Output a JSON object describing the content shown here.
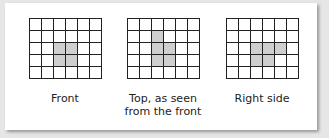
{
  "diagram": {
    "grid_rows": 5,
    "grid_cols": 6,
    "shade_color": "#cfcfcf",
    "views": [
      {
        "caption": "Front",
        "shaded": [
          [
            2,
            2
          ],
          [
            2,
            3
          ],
          [
            3,
            2
          ],
          [
            3,
            3
          ]
        ]
      },
      {
        "caption": "Top, as seen\nfrom the front",
        "shaded": [
          [
            1,
            2
          ],
          [
            2,
            2
          ],
          [
            2,
            3
          ],
          [
            3,
            2
          ],
          [
            3,
            3
          ]
        ]
      },
      {
        "caption": "Right side",
        "shaded": [
          [
            2,
            2
          ],
          [
            2,
            3
          ],
          [
            2,
            4
          ],
          [
            3,
            2
          ],
          [
            3,
            3
          ]
        ]
      }
    ]
  }
}
